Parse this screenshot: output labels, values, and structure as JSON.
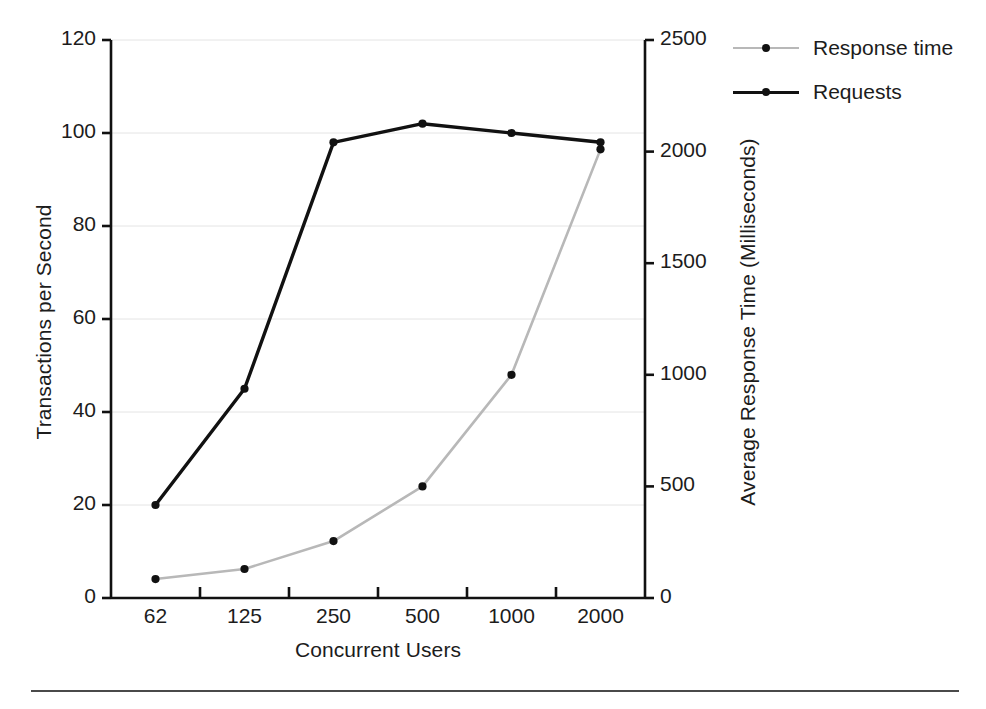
{
  "chart_data": {
    "type": "line",
    "title": "",
    "xlabel": "Concurrent Users",
    "categories": [
      "62",
      "125",
      "250",
      "500",
      "1000",
      "2000"
    ],
    "grid": true,
    "legend_position": "top-right",
    "axes": {
      "left": {
        "label": "Transactions per Second",
        "ticks": [
          "0",
          "20",
          "40",
          "60",
          "80",
          "100",
          "120"
        ],
        "tick_values": [
          0,
          20,
          40,
          60,
          80,
          100,
          120
        ],
        "lim": [
          0,
          120
        ]
      },
      "right": {
        "label": "Average Response Time (Milliseconds)",
        "ticks": [
          "0",
          "500",
          "1000",
          "1500",
          "2000",
          "2500"
        ],
        "tick_values": [
          0,
          500,
          1000,
          1500,
          2000,
          2500
        ],
        "lim": [
          0,
          2500
        ]
      }
    },
    "series": [
      {
        "name": "Response time",
        "axis": "right",
        "color": "#b8b8b8",
        "marker_color": "#111111",
        "values": [
          85,
          130,
          255,
          500,
          1000,
          2010
        ]
      },
      {
        "name": "Requests",
        "axis": "left",
        "color": "#111111",
        "marker_color": "#111111",
        "values": [
          20,
          45,
          98,
          102,
          100,
          98
        ]
      }
    ]
  },
  "legend": {
    "items": [
      {
        "label": "Response time"
      },
      {
        "label": "Requests"
      }
    ]
  },
  "caption": {
    "rule_text": ""
  }
}
